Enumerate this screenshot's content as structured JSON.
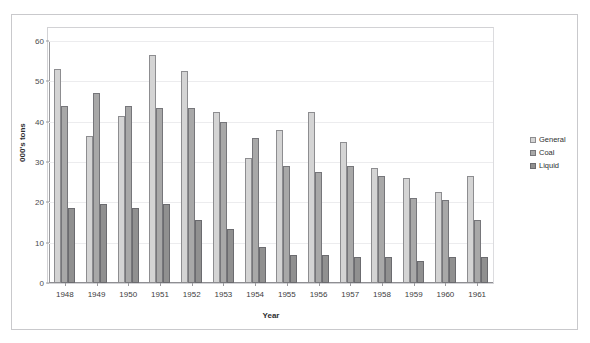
{
  "top_caption": "",
  "chart_data": {
    "type": "bar",
    "title": "",
    "xlabel": "Year",
    "ylabel": "000's tons",
    "ylim": [
      0,
      60
    ],
    "yticks": [
      0,
      10,
      20,
      30,
      40,
      50,
      60
    ],
    "grid": true,
    "legend_position": "right",
    "categories": [
      "1948",
      "1949",
      "1950",
      "1951",
      "1952",
      "1953",
      "1954",
      "1955",
      "1956",
      "1957",
      "1958",
      "1959",
      "1960",
      "1961"
    ],
    "series": [
      {
        "name": "General",
        "values": [
          53,
          36.5,
          41.5,
          56.5,
          52.5,
          42.5,
          31,
          38,
          42.5,
          35,
          28.5,
          26,
          22.5,
          26.5
        ]
      },
      {
        "name": "Coal",
        "values": [
          44,
          47,
          44,
          43.5,
          43.5,
          40,
          36,
          29,
          27.5,
          29,
          26.5,
          21,
          20.5,
          15.5
        ]
      },
      {
        "name": "Liquid",
        "values": [
          18.5,
          19.5,
          18.5,
          19.5,
          15.5,
          13.5,
          9,
          7,
          7,
          6.5,
          6.5,
          5.5,
          6.5,
          6.5
        ]
      }
    ],
    "colors": {
      "general": "#d4d4d4",
      "coal": "#a8a8a8",
      "liquid": "#909090",
      "axis": "#9a9a9e",
      "grid": "#ececee",
      "text": "#2e2e31"
    }
  }
}
